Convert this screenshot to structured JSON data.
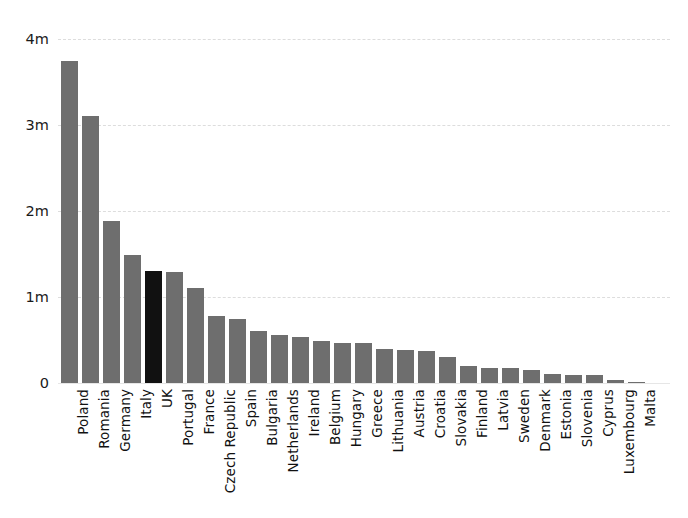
{
  "chart_data": {
    "type": "bar",
    "title": "",
    "subtitle": "",
    "xlabel": "",
    "ylabel": "",
    "ylim": [
      0,
      4000000
    ],
    "grid": true,
    "legend": null,
    "y_tick_labels": [
      "0",
      "1m",
      "2m",
      "3m",
      "4m"
    ],
    "y_tick_values": [
      0,
      1000000,
      2000000,
      3000000,
      4000000
    ],
    "orientation": "vertical",
    "bar_color": "#6e6e6e",
    "highlight_color": "#111111",
    "highlight_category": "UK",
    "categories": [
      "Poland",
      "Romania",
      "Germany",
      "Italy",
      "UK",
      "Portugal",
      "France",
      "Czech Republic",
      "Spain",
      "Bulgaria",
      "Netherlands",
      "Ireland",
      "Belgium",
      "Hungary",
      "Greece",
      "Lithuania",
      "Austria",
      "Croatia",
      "Slovakia",
      "Finland",
      "Latvia",
      "Sweden",
      "Denmark",
      "Estonia",
      "Slovenia",
      "Cyprus",
      "Luxembourg",
      "Malta"
    ],
    "values": [
      3740000,
      3110000,
      1880000,
      1490000,
      1300000,
      1290000,
      1100000,
      780000,
      740000,
      600000,
      560000,
      530000,
      490000,
      470000,
      470000,
      400000,
      380000,
      370000,
      300000,
      200000,
      180000,
      175000,
      150000,
      105000,
      95000,
      90000,
      40000,
      10000
    ]
  }
}
